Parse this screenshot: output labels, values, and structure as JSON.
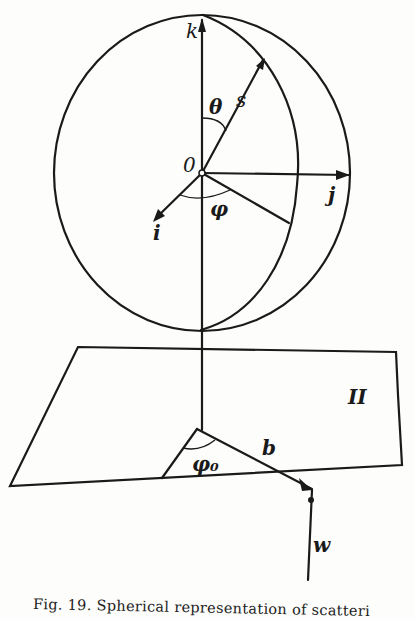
{
  "figure": {
    "caption": "Fig. 19.  Spherical representation of scatteri",
    "labels": {
      "k": "k",
      "s": "s",
      "theta": "θ",
      "origin": "0",
      "j": "j",
      "i": "i",
      "phi": "φ",
      "plane": "II",
      "phi0": "φ₀",
      "b": "b",
      "w": "w"
    }
  }
}
